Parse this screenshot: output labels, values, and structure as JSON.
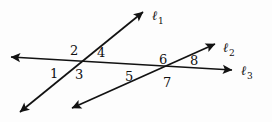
{
  "figure": {
    "type": "geometry-diagram",
    "width": 272,
    "height": 122,
    "background_color": "#fdfdfd",
    "stroke_color": "#121212",
    "stroke_width": 1.7,
    "lines": [
      {
        "id": "l1",
        "label": "ℓ",
        "subscript": "1",
        "label_x": 152,
        "label_y": 9,
        "x1": 20,
        "y1": 112,
        "x2": 143,
        "y2": 12,
        "arrow_start": true,
        "arrow_end": true
      },
      {
        "id": "l2",
        "label": "ℓ",
        "subscript": "2",
        "label_x": 223,
        "label_y": 41,
        "x1": 72,
        "y1": 108,
        "x2": 215,
        "y2": 44,
        "arrow_start": true,
        "arrow_end": true
      },
      {
        "id": "l3",
        "label": "ℓ",
        "subscript": "3",
        "label_x": 241,
        "label_y": 64,
        "x1": 11,
        "y1": 57,
        "x2": 232,
        "y2": 70,
        "arrow_start": true,
        "arrow_end": true
      }
    ],
    "intersections": [
      {
        "id": "left",
        "lines": [
          "l1",
          "l3"
        ],
        "x": 78,
        "y": 62
      },
      {
        "id": "right",
        "lines": [
          "l2",
          "l3"
        ],
        "x": 170,
        "y": 67
      }
    ],
    "angle_labels": [
      {
        "id": "angle-1",
        "text": "1",
        "x": 50,
        "y": 67,
        "intersection": "left",
        "position": "west"
      },
      {
        "id": "angle-2",
        "text": "2",
        "x": 70,
        "y": 44,
        "intersection": "left",
        "position": "north"
      },
      {
        "id": "angle-3",
        "text": "3",
        "x": 75,
        "y": 68,
        "intersection": "left",
        "position": "south"
      },
      {
        "id": "angle-4",
        "text": "4",
        "x": 97,
        "y": 46,
        "intersection": "left",
        "position": "east"
      },
      {
        "id": "angle-5",
        "text": "5",
        "x": 125,
        "y": 70,
        "intersection": "right",
        "position": "west"
      },
      {
        "id": "angle-6",
        "text": "6",
        "x": 159,
        "y": 53,
        "intersection": "right",
        "position": "north"
      },
      {
        "id": "angle-7",
        "text": "7",
        "x": 163,
        "y": 76,
        "intersection": "right",
        "position": "south"
      },
      {
        "id": "angle-8",
        "text": "8",
        "x": 190,
        "y": 54,
        "intersection": "right",
        "position": "east"
      }
    ]
  }
}
